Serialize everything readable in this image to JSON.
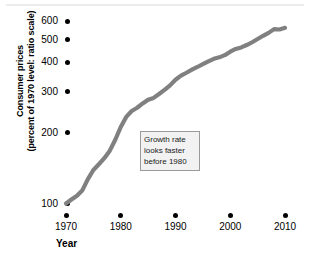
{
  "chart_data": {
    "type": "line",
    "title": "",
    "subtitle": "",
    "xlabel": "Year",
    "ylabel": "Consumer prices (percent of 1970 level: ratio scale)",
    "ylabel_lines": [
      "Consumer prices",
      "(percent of 1970 level: ratio scale)"
    ],
    "scale": "log",
    "grid": false,
    "legend": false,
    "xlim": [
      1968,
      2012
    ],
    "ylim": [
      90,
      640
    ],
    "xticks": [
      1970,
      1980,
      1990,
      2000,
      2010
    ],
    "xtick_labels": [
      "1970",
      "1980",
      "1990",
      "2000",
      "2010"
    ],
    "yticks": [
      100,
      200,
      300,
      400,
      500,
      600
    ],
    "ytick_labels": [
      "100",
      "200",
      "300",
      "400",
      "500",
      "600"
    ],
    "series": [
      {
        "name": "Consumer prices",
        "color": "#808080",
        "x": [
          1970,
          1971,
          1972,
          1973,
          1974,
          1975,
          1976,
          1977,
          1978,
          1979,
          1980,
          1981,
          1982,
          1983,
          1984,
          1985,
          1986,
          1987,
          1988,
          1989,
          1990,
          1991,
          1992,
          1993,
          1994,
          1995,
          1996,
          1997,
          1998,
          1999,
          2000,
          2001,
          2002,
          2003,
          2004,
          2005,
          2006,
          2007,
          2008,
          2009,
          2010
        ],
        "values": [
          100,
          104,
          108,
          114,
          127,
          139,
          147,
          156,
          168,
          187,
          212,
          234,
          248,
          256,
          267,
          277,
          282,
          293,
          305,
          319,
          337,
          351,
          361,
          372,
          382,
          393,
          404,
          414,
          420,
          429,
          444,
          456,
          463,
          474,
          487,
          503,
          519,
          534,
          554,
          552,
          561
        ]
      }
    ],
    "annotations": [
      {
        "name": "growth-rate-note",
        "lines": [
          "Growth rate",
          "looks faster",
          "before 1980"
        ],
        "x": 1987,
        "y": 165
      }
    ],
    "colors": {
      "line": "#808080",
      "text": "#000000",
      "annotation_border": "#9a9a9a",
      "annotation_fill": "#f2f2f2",
      "top_rule": "#ececec"
    }
  }
}
